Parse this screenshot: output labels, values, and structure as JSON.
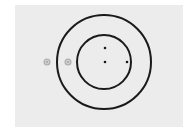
{
  "diagram": {
    "background": "#ececec",
    "stroke_color": "#1a1a1a",
    "center": [
      104,
      62
    ],
    "outer_circle": {
      "radius": 47
    },
    "inner_circle": {
      "radius": 27
    },
    "dots": [
      {
        "x": 105,
        "y": 48
      },
      {
        "x": 105,
        "y": 62
      },
      {
        "x": 127,
        "y": 62
      }
    ],
    "markers": [
      {
        "x": 47,
        "y": 62,
        "color": "#9a9a9a"
      },
      {
        "x": 68,
        "y": 62,
        "color": "#9a9a9a"
      }
    ]
  }
}
